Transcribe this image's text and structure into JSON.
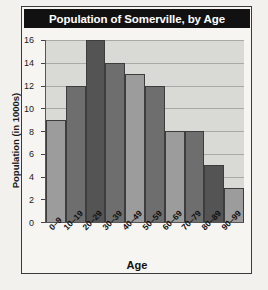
{
  "chart_data": {
    "type": "bar",
    "title": "Population of Somerville, by Age",
    "xlabel": "Age",
    "ylabel": "Population (in 1000s)",
    "categories": [
      "0–9",
      "10–19",
      "20–29",
      "30–39",
      "40–49",
      "50–59",
      "60–69",
      "70–79",
      "80–89",
      "90–99"
    ],
    "values": [
      9,
      12,
      16,
      14,
      13,
      12,
      8,
      8,
      5,
      3
    ],
    "ylim": [
      0,
      16
    ],
    "yticks": [
      0,
      2,
      4,
      6,
      8,
      10,
      12,
      14,
      16
    ],
    "ytick_labels": [
      "0",
      "2",
      "4",
      "6",
      "8",
      "10",
      "12",
      "14",
      "16"
    ],
    "grid": true,
    "legend": false,
    "bar_styles": [
      "light",
      "dark",
      "darkest",
      "dark",
      "light",
      "dark",
      "light",
      "dark",
      "darkest",
      "light"
    ],
    "colors": {
      "title_banner_bg": "#111111",
      "title_text": "#ffffff",
      "plot_bg": "#d9d9d6",
      "gridline": "#a9a9a6",
      "bar_light": "#9c9c9c",
      "bar_dark": "#6e6e6e",
      "bar_darkest": "#545454",
      "bar_edge": "#3d3d3d",
      "page_bg": "#f2f1ee",
      "frame_border": "#3a3a3a"
    }
  }
}
